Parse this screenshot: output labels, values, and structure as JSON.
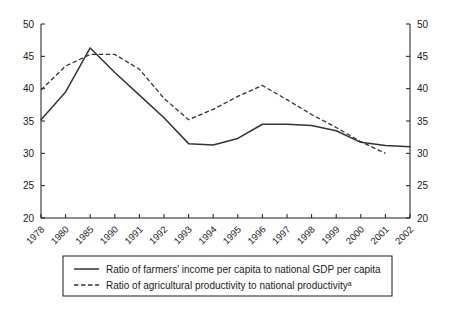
{
  "chart_data": {
    "type": "line",
    "title": "",
    "xlabel": "",
    "ylabel": "",
    "ylim": [
      20,
      50
    ],
    "yticks": [
      20,
      25,
      30,
      35,
      40,
      45,
      50
    ],
    "grid": false,
    "dual_axis": true,
    "legend_position": "bottom",
    "categories": [
      "1978",
      "1980",
      "1985",
      "1990",
      "1991",
      "1992",
      "1993",
      "1994",
      "1995",
      "1996",
      "1997",
      "1998",
      "1999",
      "2000",
      "2001",
      "2002"
    ],
    "series": [
      {
        "name": "Ratio of farmers' income per capita to national GDP per capita",
        "style": "solid",
        "values": [
          35.2,
          39.5,
          46.3,
          42.5,
          39.0,
          35.5,
          31.5,
          31.3,
          32.3,
          34.5,
          34.5,
          34.3,
          33.5,
          31.7,
          31.2,
          31.0
        ]
      },
      {
        "name": "Ratio of agricultural productivity to national productivity",
        "style": "dashed",
        "note_marker": "a",
        "values": [
          39.8,
          43.5,
          45.3,
          45.3,
          43.0,
          38.5,
          35.2,
          36.8,
          38.8,
          40.5,
          38.3,
          36.0,
          34.0,
          31.8,
          30.0,
          null
        ]
      }
    ]
  },
  "axes": {
    "left_tick_labels": [
      "50",
      "45",
      "40",
      "35",
      "30",
      "25",
      "20"
    ],
    "right_tick_labels": [
      "50",
      "45",
      "40",
      "35",
      "30",
      "25",
      "20"
    ]
  },
  "legend": {
    "items": [
      {
        "label": "Ratio of farmers' income per capita to national GDP per capita",
        "sup": "",
        "style": "solid"
      },
      {
        "label": "Ratio of agricultural productivity to national productivity",
        "sup": "a",
        "style": "dashed"
      }
    ]
  }
}
